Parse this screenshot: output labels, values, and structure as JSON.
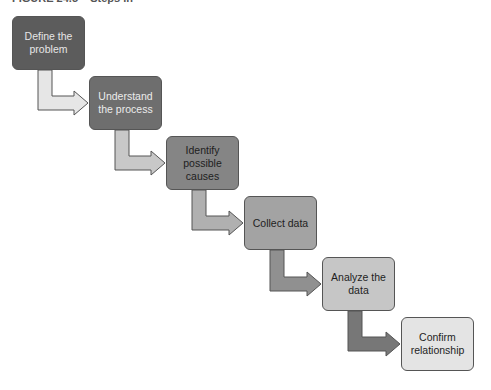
{
  "caption": "FIGURE 24.5 – Steps in",
  "steps": [
    {
      "label": "Define the problem",
      "fill": "#5c5c5c",
      "text": "#e6e6e6"
    },
    {
      "label": "Understand the process",
      "fill": "#6e6e6e",
      "text": "#ececec"
    },
    {
      "label": "Identify possible causes",
      "fill": "#858585",
      "text": "#1e1e1e"
    },
    {
      "label": "Collect data",
      "fill": "#a3a3a3",
      "text": "#1e1e1e"
    },
    {
      "label": "Analyze the data",
      "fill": "#c6c6c6",
      "text": "#1e1e1e"
    },
    {
      "label": "Confirm relationship",
      "fill": "#e4e4e4",
      "text": "#1e1e1e"
    }
  ],
  "arrows": [
    {
      "from": 0,
      "to": 1,
      "fill": "#e6e6e6"
    },
    {
      "from": 1,
      "to": 2,
      "fill": "#c8c8c8"
    },
    {
      "from": 2,
      "to": 3,
      "fill": "#b0b0b0"
    },
    {
      "from": 3,
      "to": 4,
      "fill": "#909090"
    },
    {
      "from": 4,
      "to": 5,
      "fill": "#777777"
    }
  ]
}
